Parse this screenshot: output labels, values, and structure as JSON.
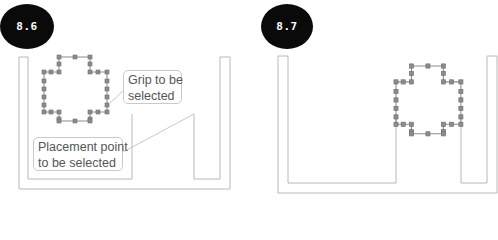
{
  "figures": [
    {
      "label": "8.6",
      "callouts": [
        {
          "text_line1": "Grip to be",
          "text_line2": "selected"
        },
        {
          "text_line1": "Placement point",
          "text_line2": "to be selected"
        }
      ]
    },
    {
      "label": "8.7"
    }
  ],
  "colors": {
    "badge_bg": "#0a0a0a",
    "badge_text": "#ffffff",
    "outline": "#b8b8b8",
    "grip_fill": "#8c8c8c",
    "grip_line": "#777777",
    "callout_text": "#555555"
  }
}
